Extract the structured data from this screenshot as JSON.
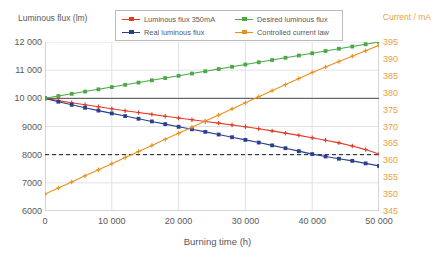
{
  "chart_data": {
    "type": "line",
    "title": "",
    "xlabel": "Burning time (h)",
    "ylabel": "Luminous flux (lm)",
    "ylabel_right": "Current / mA",
    "xlim": [
      0,
      50000
    ],
    "ylim": [
      6000,
      12000
    ],
    "ylim_right": [
      345,
      395
    ],
    "grid": true,
    "legend_position": "top-center",
    "xticks": [
      0,
      10000,
      20000,
      30000,
      40000,
      50000
    ],
    "xticklabels": [
      "0",
      "10 000",
      "20 000",
      "30 000",
      "40 000",
      "50 000"
    ],
    "yticks": [
      6000,
      7000,
      8000,
      9000,
      10000,
      11000,
      12000
    ],
    "yticklabels": [
      "6000",
      "7000",
      "8000",
      "9000",
      "10 000",
      "11 000",
      "12 000"
    ],
    "yticks_right": [
      345,
      350,
      355,
      360,
      365,
      370,
      375,
      380,
      385,
      390,
      395
    ],
    "yticklabels_right": [
      "345",
      "350",
      "355",
      "360",
      "365",
      "370",
      "375",
      "380",
      "385",
      "390",
      "395"
    ],
    "x": [
      0,
      2000,
      4000,
      6000,
      8000,
      10000,
      12000,
      14000,
      16000,
      18000,
      20000,
      22000,
      24000,
      26000,
      28000,
      30000,
      32000,
      34000,
      36000,
      38000,
      40000,
      42000,
      44000,
      46000,
      48000,
      50000
    ],
    "series": [
      {
        "name": "Luminous flux 350mA",
        "color": "#e03b25",
        "axis": "left",
        "marker": "plus",
        "values": [
          10000,
          9920,
          9845,
          9770,
          9700,
          9630,
          9560,
          9495,
          9430,
          9365,
          9300,
          9240,
          9180,
          9120,
          9055,
          8990,
          8920,
          8845,
          8765,
          8685,
          8600,
          8510,
          8420,
          8310,
          8180,
          8020
        ]
      },
      {
        "name": "Real luminous flux",
        "color": "#2a3f8f",
        "axis": "left",
        "marker": "square",
        "values": [
          10000,
          9880,
          9770,
          9665,
          9565,
          9465,
          9370,
          9275,
          9180,
          9085,
          8990,
          8900,
          8810,
          8715,
          8620,
          8525,
          8430,
          8330,
          8230,
          8125,
          8020,
          7935,
          7855,
          7780,
          7690,
          7600
        ]
      },
      {
        "name": "Desired luminous flux",
        "color": "#4aa845",
        "axis": "left",
        "marker": "square",
        "values": [
          10000,
          10080,
          10160,
          10240,
          10320,
          10400,
          10480,
          10560,
          10640,
          10720,
          10800,
          10880,
          10960,
          11040,
          11120,
          11200,
          11280,
          11360,
          11440,
          11520,
          11600,
          11680,
          11760,
          11840,
          11920,
          12000
        ]
      },
      {
        "name": "Controlled current law",
        "color": "#e8901f",
        "axis": "right",
        "marker": "plus",
        "values": [
          350.0,
          351.8,
          353.6,
          355.4,
          357.2,
          359.0,
          360.8,
          362.6,
          364.4,
          366.2,
          368.0,
          369.8,
          371.6,
          373.4,
          375.2,
          377.0,
          378.8,
          380.6,
          382.4,
          384.2,
          386.0,
          387.6,
          389.2,
          390.8,
          392.4,
          394.0
        ]
      }
    ],
    "reference_lines": [
      {
        "name": "nominal-10000",
        "axis": "left",
        "value": 10000,
        "style": "solid",
        "color": "#4d4d4d"
      },
      {
        "name": "threshold-8000",
        "axis": "left",
        "value": 8000,
        "style": "dashed",
        "color": "#1a1a1a"
      }
    ]
  },
  "legend": {
    "items": [
      {
        "label": "Luminous flux 350mA",
        "color": "#e03b25"
      },
      {
        "label": "Desired luminous flux",
        "color": "#4aa845"
      },
      {
        "label": "Real luminous flux",
        "color": "#2a3f8f"
      },
      {
        "label": "Controlled current law",
        "color": "#e8901f"
      }
    ]
  },
  "colors": {
    "grid": "#dfe3e6",
    "axis": "#b9babb",
    "text": "#58595b",
    "right_axis_text": "#e8a33d"
  }
}
